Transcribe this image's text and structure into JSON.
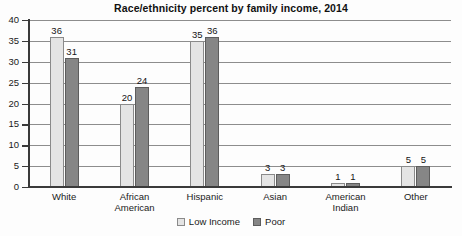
{
  "chart_data": {
    "type": "bar",
    "title": "Race/ethnicity percent by family income, 2014",
    "xlabel": "",
    "ylabel": "",
    "ylim": [
      0,
      40
    ],
    "yticks": [
      0,
      5,
      10,
      15,
      20,
      25,
      30,
      35,
      40
    ],
    "grid": true,
    "legend_position": "bottom-center",
    "categories": [
      "White",
      "African American",
      "Hispanic",
      "Asian",
      "American Indian",
      "Other"
    ],
    "category_lines": [
      [
        "White"
      ],
      [
        "African",
        "American"
      ],
      [
        "Hispanic"
      ],
      [
        "Asian"
      ],
      [
        "American",
        "Indian"
      ],
      [
        "Other"
      ]
    ],
    "series": [
      {
        "name": "Low Income",
        "color": "#e4e4e4",
        "values": [
          36,
          20,
          35,
          3,
          1,
          5
        ]
      },
      {
        "name": "Poor",
        "color": "#868686",
        "values": [
          31,
          24,
          36,
          3,
          1,
          5
        ]
      }
    ]
  },
  "legend": {
    "items": [
      {
        "label": "Low Income",
        "style": "light"
      },
      {
        "label": "Poor",
        "style": "dark"
      }
    ]
  }
}
